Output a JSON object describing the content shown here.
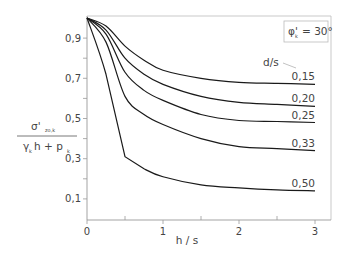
{
  "chart_data": {
    "type": "line",
    "title": "",
    "xlabel": "h / s",
    "ylabel": "σ'zo,k / (γk h + pk)",
    "ylabel_parts": {
      "num_main": "σ'",
      "num_sub": "zo,k",
      "den_gamma": "γ",
      "den_gamma_sub": "k",
      "den_h": "h + p",
      "den_p_sub": "k"
    },
    "annotation": {
      "phi": "φ'",
      "phi_sub": "k",
      "phi_value": "= 30°"
    },
    "legend_title": "d/s",
    "xlim": [
      0,
      3.2
    ],
    "ylim": [
      0,
      1.0
    ],
    "x_ticks": [
      "0",
      "1",
      "2",
      "3"
    ],
    "y_ticks": [
      "0,1",
      "0,3",
      "0,5",
      "0,7",
      "0,9"
    ],
    "grid": false,
    "x": [
      0,
      0.25,
      0.5,
      0.75,
      1.0,
      1.5,
      2.0,
      2.5,
      3.0
    ],
    "series": [
      {
        "name": "0,15",
        "values": [
          1.0,
          0.96,
          0.86,
          0.79,
          0.74,
          0.7,
          0.68,
          0.675,
          0.67
        ]
      },
      {
        "name": "0,20",
        "values": [
          1.0,
          0.94,
          0.8,
          0.72,
          0.67,
          0.61,
          0.58,
          0.57,
          0.56
        ]
      },
      {
        "name": "0,25",
        "values": [
          1.0,
          0.92,
          0.73,
          0.64,
          0.59,
          0.52,
          0.49,
          0.485,
          0.48
        ]
      },
      {
        "name": "0,33",
        "values": [
          1.0,
          0.88,
          0.61,
          0.52,
          0.47,
          0.4,
          0.36,
          0.35,
          0.34
        ]
      },
      {
        "name": "0,50",
        "values": [
          1.0,
          0.72,
          0.31,
          0.25,
          0.21,
          0.17,
          0.155,
          0.145,
          0.14
        ]
      }
    ]
  }
}
